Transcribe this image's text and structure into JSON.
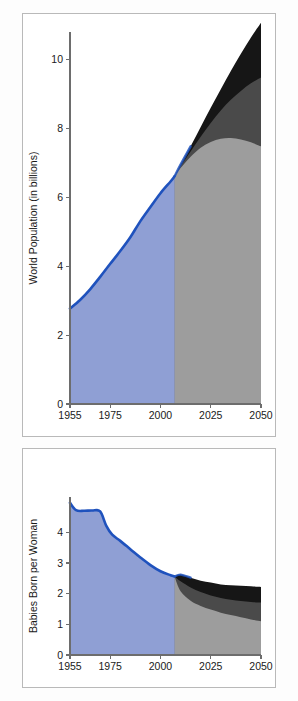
{
  "figure": {
    "background_color": "#fdfdfd",
    "frame_color": "#b9b9b9"
  },
  "colors": {
    "historical_fill": "#8f9fd4",
    "historical_line": "#1f52bd",
    "projection_low": "#9d9d9d",
    "projection_medium": "#4a4a4a",
    "projection_high": "#161616",
    "axis": "#6d6d6d",
    "text": "#1a1a1a"
  },
  "chart_data": [
    {
      "id": "world-population",
      "type": "area",
      "title": "",
      "xlabel": "",
      "ylabel": "World Population (in billions)",
      "xlim": [
        1955,
        2050
      ],
      "ylim": [
        0,
        10.8
      ],
      "xticks": [
        1955,
        1975,
        2000,
        2025,
        2050
      ],
      "xticklabels": [
        "1955",
        "1975",
        "2000",
        "2025",
        "2050"
      ],
      "yticks": [
        0,
        2,
        4,
        6,
        8,
        10
      ],
      "yticklabels": [
        "0",
        "2",
        "4",
        "6",
        "8",
        "10"
      ],
      "grid": false,
      "legend": "none",
      "projection_start_year": 2007,
      "x": [
        1955,
        1960,
        1965,
        1970,
        1975,
        1980,
        1985,
        1990,
        1995,
        2000,
        2005,
        2007
      ],
      "series": [
        {
          "name": "Historical (estimates)",
          "style": "filled-area-blue",
          "values": [
            2.77,
            3.02,
            3.33,
            3.69,
            4.07,
            4.44,
            4.84,
            5.31,
            5.72,
            6.12,
            6.46,
            6.61
          ]
        }
      ],
      "projections": {
        "x": [
          2007,
          2010,
          2015,
          2020,
          2025,
          2030,
          2035,
          2040,
          2045,
          2050
        ],
        "bands": [
          {
            "name": "Low variant",
            "style": "filled-area-light-gray",
            "values": [
              6.61,
              6.85,
              7.18,
              7.44,
              7.61,
              7.7,
              7.72,
              7.68,
              7.6,
              7.48
            ]
          },
          {
            "name": "Medium variant",
            "style": "filled-area-dark-gray",
            "values": [
              6.61,
              6.9,
              7.33,
              7.76,
              8.16,
              8.52,
              8.83,
              9.09,
              9.31,
              9.48
            ]
          },
          {
            "name": "High variant",
            "style": "filled-area-black",
            "values": [
              6.61,
              6.95,
              7.48,
              8.04,
              8.6,
              9.14,
              9.67,
              10.17,
              10.64,
              11.07
            ]
          }
        ]
      }
    },
    {
      "id": "babies-born-per-woman",
      "type": "area",
      "title": "",
      "xlabel": "",
      "ylabel": "Babies Born  per Woman",
      "xlim": [
        1955,
        2050
      ],
      "ylim": [
        0,
        5.15
      ],
      "xticks": [
        1955,
        1975,
        2000,
        2025,
        2050
      ],
      "xticklabels": [
        "1955",
        "1975",
        "2000",
        "2025",
        "2050"
      ],
      "yticks": [
        0,
        1,
        2,
        3,
        4
      ],
      "yticklabels": [
        "0",
        "1",
        "2",
        "3",
        "4"
      ],
      "grid": false,
      "legend": "none",
      "projection_start_year": 2007,
      "x": [
        1955,
        1958,
        1962,
        1966,
        1970,
        1973,
        1976,
        1980,
        1985,
        1990,
        1995,
        2000,
        2005,
        2007
      ],
      "series": [
        {
          "name": "Historical (estimates)",
          "style": "filled-area-blue",
          "values": [
            4.96,
            4.72,
            4.7,
            4.71,
            4.68,
            4.22,
            3.92,
            3.72,
            3.45,
            3.18,
            2.93,
            2.73,
            2.6,
            2.56
          ]
        }
      ],
      "projections": {
        "x": [
          2007,
          2010,
          2015,
          2020,
          2025,
          2030,
          2035,
          2040,
          2045,
          2050
        ],
        "bands": [
          {
            "name": "Low variant",
            "style": "filled-area-light-gray",
            "values": [
              2.56,
              2.08,
              1.77,
              1.6,
              1.48,
              1.38,
              1.3,
              1.23,
              1.16,
              1.1
            ]
          },
          {
            "name": "Medium variant",
            "style": "filled-area-dark-gray",
            "values": [
              2.56,
              2.4,
              2.2,
              2.05,
              1.94,
              1.86,
              1.8,
              1.76,
              1.73,
              1.71
            ]
          },
          {
            "name": "High variant",
            "style": "filled-area-black",
            "values": [
              2.56,
              2.62,
              2.52,
              2.42,
              2.36,
              2.3,
              2.27,
              2.26,
              2.24,
              2.22
            ]
          }
        ]
      }
    }
  ]
}
